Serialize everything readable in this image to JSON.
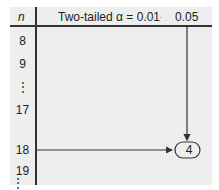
{
  "table": {
    "header": {
      "n": "n",
      "alpha_label": "Two-tailed α = 0.01",
      "ellipsis": "· · ·",
      "alpha_005": "0.05"
    },
    "rows": [
      "8",
      "9",
      "⋮",
      "17",
      "18",
      "19",
      "⋮"
    ],
    "highlight": {
      "row": "18",
      "column": "0.05",
      "value": "4"
    }
  }
}
